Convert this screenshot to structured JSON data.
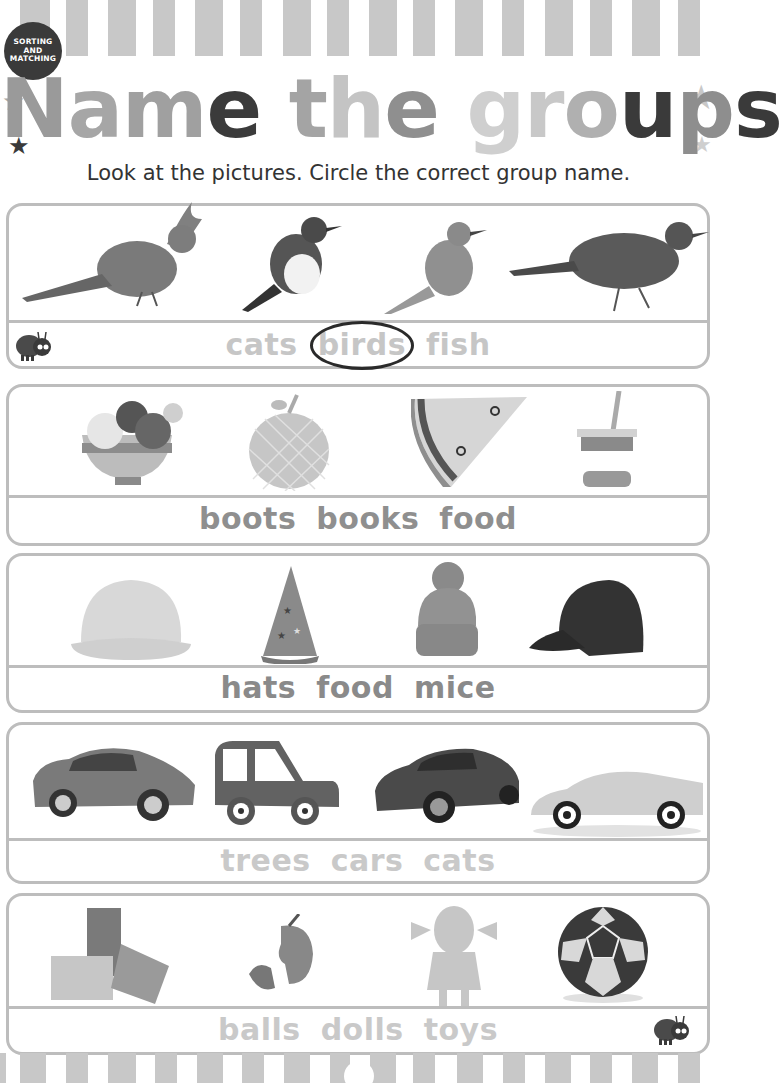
{
  "badge": {
    "line1": "SORTING AND",
    "line2": "MATCHING"
  },
  "title": {
    "letters": [
      {
        "ch": "N",
        "color": "#9a9a9a"
      },
      {
        "ch": "a",
        "color": "#a6a6a6"
      },
      {
        "ch": "m",
        "color": "#a0a0a0"
      },
      {
        "ch": "e",
        "color": "#3b3b3b"
      },
      {
        "ch": " ",
        "color": "#fff"
      },
      {
        "ch": "t",
        "color": "#a4a4a4"
      },
      {
        "ch": "h",
        "color": "#c4c4c4"
      },
      {
        "ch": "e",
        "color": "#8f8f8f"
      },
      {
        "ch": " ",
        "color": "#fff"
      },
      {
        "ch": "g",
        "color": "#cfcfcf"
      },
      {
        "ch": "r",
        "color": "#c8c8c8"
      },
      {
        "ch": "o",
        "color": "#b0b0b0"
      },
      {
        "ch": "u",
        "color": "#3a3a3a"
      },
      {
        "ch": "p",
        "color": "#8e8e8e"
      },
      {
        "ch": "s",
        "color": "#3a3a3a"
      }
    ]
  },
  "subtitle": "Look at the pictures. Circle the correct group name.",
  "panels": [
    {
      "pictures": [
        "cardinal",
        "robin",
        "bluebird",
        "blackbird"
      ],
      "words": [
        "cats",
        "birds",
        "fish"
      ],
      "circled": "birds",
      "word_color": "#c6c6c6"
    },
    {
      "pictures": [
        "ice-cream-sundae",
        "apple",
        "pizza-slice",
        "yogurt"
      ],
      "words": [
        "boots",
        "books",
        "food"
      ],
      "circled": null,
      "word_color": "#8f8f8f"
    },
    {
      "pictures": [
        "hard-hat",
        "party-hat",
        "bobble-hat",
        "baseball-cap"
      ],
      "words": [
        "hats",
        "food",
        "mice"
      ],
      "circled": null,
      "word_color": "#8a8a8a"
    },
    {
      "pictures": [
        "sedan",
        "cartoon-car",
        "sports-sedan",
        "sports-car"
      ],
      "words": [
        "trees",
        "cars",
        "cats"
      ],
      "circled": null,
      "word_color": "#c9c9c9"
    },
    {
      "pictures": [
        "building-blocks",
        "jigsaw-puzzle",
        "doll",
        "soccer-ball"
      ],
      "words": [
        "balls",
        "dolls",
        "toys"
      ],
      "circled": null,
      "word_color": "#c9c9c9"
    }
  ]
}
